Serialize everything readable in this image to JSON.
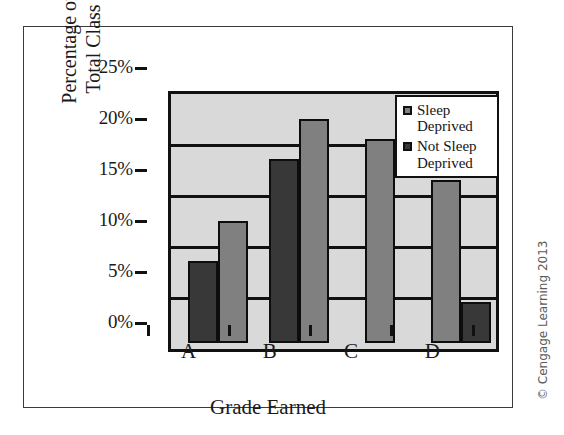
{
  "figure": {
    "credit": "© Cengage Learning 2013"
  },
  "legend": {
    "position": "top-right",
    "entries": [
      {
        "label": "Sleep\nDeprived",
        "color": "#808080",
        "name": "sleep-deprived"
      },
      {
        "label": "Not Sleep\nDeprived",
        "color": "#383838",
        "name": "not-sleep-deprived"
      }
    ]
  },
  "chart_data": {
    "type": "bar",
    "title": "",
    "subtitle": "",
    "xlabel": "Grade Earned",
    "ylabel": "Percentage of\nTotal Class",
    "ylabel_lines": [
      "Percentage of",
      "Total Class"
    ],
    "categories": [
      "A",
      "B",
      "C",
      "D"
    ],
    "series": [
      {
        "name": "Sleep Deprived",
        "color": "#808080",
        "values": [
          12,
          22,
          20,
          16
        ]
      },
      {
        "name": "Not Sleep Deprived",
        "color": "#383838",
        "values": [
          8,
          18,
          0,
          4
        ]
      }
    ],
    "bar_order_by_category": [
      [
        "Not Sleep Deprived",
        "Sleep Deprived"
      ],
      [
        "Not Sleep Deprived",
        "Sleep Deprived"
      ],
      [
        "Sleep Deprived"
      ],
      [
        "Sleep Deprived",
        "Not Sleep Deprived"
      ]
    ],
    "ylim": [
      0,
      25
    ],
    "yticks": [
      0,
      5,
      10,
      15,
      20,
      25
    ],
    "ytick_labels": [
      "0%",
      "5%",
      "10%",
      "15%",
      "20%",
      "25%"
    ],
    "grid": true,
    "grid_axis": "y",
    "legend_position": "upper right",
    "plot_background": "#d9d9d9",
    "axis_color": "#111111"
  }
}
